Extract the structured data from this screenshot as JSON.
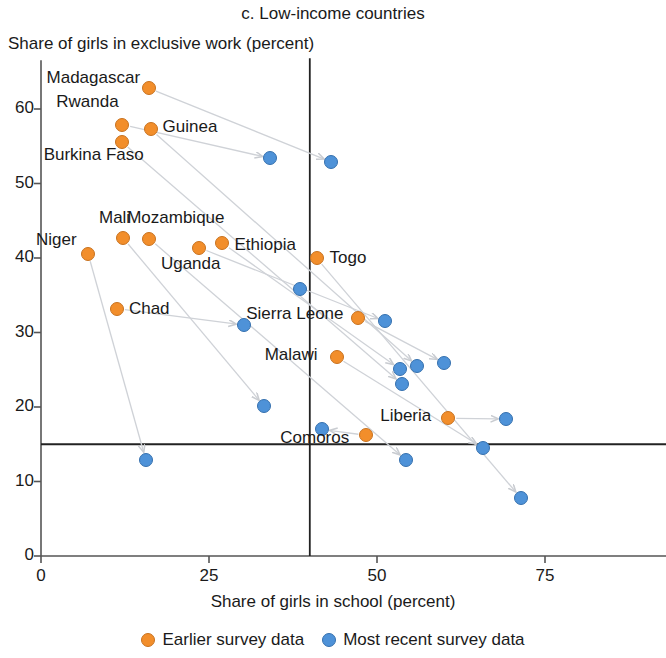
{
  "panel": {
    "title": "c. Low-income countries",
    "ylabel": "Share of girls in exclusive work (percent)",
    "xlabel": "Share of girls in school (percent)"
  },
  "legend": {
    "earlier": "Earlier survey data",
    "recent": "Most recent survey data"
  },
  "colors": {
    "earlier": "#f28e2b",
    "recent": "#4e92d8",
    "axis": "#555555",
    "reference": "#222222"
  },
  "chart_data": {
    "type": "scatter",
    "title": "c. Low-income countries",
    "xlabel": "Share of girls in school (percent)",
    "ylabel": "Share of girls in exclusive work (percent)",
    "xlim": [
      0,
      95
    ],
    "ylim": [
      0,
      66
    ],
    "xticks": [
      0,
      25,
      50,
      75
    ],
    "yticks": [
      0,
      10,
      20,
      30,
      40,
      50,
      60
    ],
    "grid": false,
    "legend_position": "below-axis",
    "reference_lines": {
      "vertical_x": 40,
      "horizontal_y": 15
    },
    "series": [
      {
        "name": "Earlier survey data",
        "color": "#f28e2b"
      },
      {
        "name": "Most recent survey data",
        "color": "#4e92d8"
      }
    ],
    "points": [
      {
        "country": "Madagascar",
        "earlier": {
          "x": 16.0,
          "y": 62.8
        },
        "recent": {
          "x": 43.2,
          "y": 52.9
        }
      },
      {
        "country": "Rwanda",
        "earlier": {
          "x": 12.1,
          "y": 57.9
        },
        "recent": {
          "x": 34.1,
          "y": 53.4
        }
      },
      {
        "country": "Guinea",
        "earlier": {
          "x": 16.3,
          "y": 57.3
        },
        "recent": {
          "x": 56.0,
          "y": 25.5
        }
      },
      {
        "country": "Burkina Faso",
        "earlier": {
          "x": 12.0,
          "y": 55.6
        },
        "recent": {
          "x": 53.7,
          "y": 23.1
        }
      },
      {
        "country": "Niger",
        "earlier": {
          "x": 7.0,
          "y": 40.6
        },
        "recent": {
          "x": 15.6,
          "y": 12.9
        }
      },
      {
        "country": "Mali",
        "earlier": {
          "x": 12.2,
          "y": 42.7
        },
        "recent": {
          "x": 33.2,
          "y": 20.1
        }
      },
      {
        "country": "Mozambique",
        "earlier": {
          "x": 16.1,
          "y": 42.6
        },
        "recent": {
          "x": 54.3,
          "y": 12.9
        }
      },
      {
        "country": "Uganda",
        "earlier": {
          "x": 23.5,
          "y": 41.4
        },
        "recent": {
          "x": 51.2,
          "y": 31.5
        }
      },
      {
        "country": "Ethiopia",
        "earlier": {
          "x": 27.0,
          "y": 42.0
        },
        "recent": {
          "x": 53.4,
          "y": 25.1
        }
      },
      {
        "country": "Togo",
        "earlier": {
          "x": 41.0,
          "y": 40.0
        },
        "recent": {
          "x": 71.4,
          "y": 7.8
        }
      },
      {
        "country": "Chad",
        "earlier": {
          "x": 11.3,
          "y": 33.2
        },
        "recent": {
          "x": 30.2,
          "y": 31.0
        }
      },
      {
        "country": "Sierra Leone",
        "earlier": {
          "x": 47.2,
          "y": 32.0
        },
        "recent": {
          "x": 60.0,
          "y": 25.9
        }
      },
      {
        "country": "Malawi",
        "earlier": {
          "x": 44.0,
          "y": 26.7
        },
        "recent": {
          "x": 65.8,
          "y": 14.5
        }
      },
      {
        "country": "Liberia",
        "earlier": {
          "x": 60.6,
          "y": 18.5
        },
        "recent": {
          "x": 69.2,
          "y": 18.4
        }
      },
      {
        "country": "Comoros",
        "earlier": {
          "x": 48.4,
          "y": 16.2
        },
        "recent": {
          "x": 41.8,
          "y": 17.0
        }
      },
      {
        "country": "",
        "earlier": null,
        "recent": {
          "x": 38.5,
          "y": 35.9
        }
      }
    ],
    "country_labels": [
      {
        "text": "Madagascar",
        "x": 16.0,
        "y": 62.8
      },
      {
        "text": "Rwanda",
        "x": 12.1,
        "y": 57.9
      },
      {
        "text": "Guinea",
        "x": 16.3,
        "y": 57.3
      },
      {
        "text": "Burkina Faso",
        "x": 12.0,
        "y": 55.6
      },
      {
        "text": "Niger",
        "x": 7.0,
        "y": 40.6
      },
      {
        "text": "Mali",
        "x": 12.2,
        "y": 42.7
      },
      {
        "text": "Mozambique",
        "x": 16.1,
        "y": 42.6
      },
      {
        "text": "Uganda",
        "x": 23.5,
        "y": 41.4
      },
      {
        "text": "Ethiopia",
        "x": 27.0,
        "y": 42.0
      },
      {
        "text": "Togo",
        "x": 41.0,
        "y": 40.0
      },
      {
        "text": "Chad",
        "x": 11.3,
        "y": 33.2
      },
      {
        "text": "Sierra Leone",
        "x": 47.2,
        "y": 32.0
      },
      {
        "text": "Malawi",
        "x": 44.0,
        "y": 26.7
      },
      {
        "text": "Liberia",
        "x": 60.6,
        "y": 18.5
      },
      {
        "text": "Comoros",
        "x": 48.4,
        "y": 16.2
      }
    ]
  },
  "axis": {
    "y_tick_labels": [
      "60",
      "50",
      "40",
      "30",
      "20",
      "10",
      "0"
    ],
    "x_tick_labels": [
      "0",
      "25",
      "50",
      "75"
    ]
  },
  "label_offsets": {
    "Madagascar": {
      "dx": -102,
      "dy": -10,
      "align": "left"
    },
    "Rwanda": {
      "dx": -66,
      "dy": -23,
      "align": "left"
    },
    "Guinea": {
      "dx": 12,
      "dy": -2,
      "align": "left"
    },
    "Burkina Faso": {
      "dx": -78,
      "dy": 13,
      "align": "left"
    },
    "Niger": {
      "dx": -52,
      "dy": -14,
      "align": "left"
    },
    "Mali": {
      "dx": -24,
      "dy": -20,
      "align": "left"
    },
    "Mozambique": {
      "dx": -22,
      "dy": -21,
      "align": "left"
    },
    "Uganda": {
      "dx": -38,
      "dy": 16,
      "align": "left"
    },
    "Ethiopia": {
      "dx": 12,
      "dy": 2,
      "align": "left"
    },
    "Togo": {
      "dx": 13,
      "dy": 0,
      "align": "left"
    },
    "Chad": {
      "dx": 12,
      "dy": 0,
      "align": "left"
    },
    "Sierra Leone": {
      "dx": -112,
      "dy": -4,
      "align": "left"
    },
    "Malawi": {
      "dx": -72,
      "dy": -2,
      "align": "left"
    },
    "Liberia": {
      "dx": -68,
      "dy": -2,
      "align": "left"
    },
    "Comoros": {
      "dx": -86,
      "dy": 3,
      "align": "left"
    }
  }
}
